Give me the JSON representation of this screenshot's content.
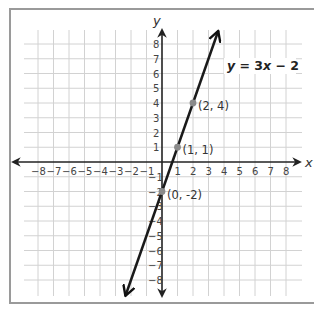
{
  "chart_data": {
    "type": "line",
    "title": "",
    "xlabel": "x",
    "ylabel": "y",
    "xlim": [
      -8,
      8
    ],
    "ylim": [
      -8,
      8
    ],
    "grid": true,
    "x_ticks": [
      "-8",
      "-7",
      "-6",
      "-5",
      "-4",
      "-3",
      "-2",
      "-1",
      "1",
      "2",
      "3",
      "4",
      "5",
      "6",
      "7",
      "8"
    ],
    "y_ticks": [
      "8",
      "7",
      "6",
      "5",
      "4",
      "3",
      "2",
      "1",
      "-1",
      "-2",
      "-3",
      "-4",
      "-5",
      "-6",
      "-7",
      "-8"
    ],
    "series": [
      {
        "name": "y = 3x - 2",
        "equation": "y = 3x − 2",
        "slope": 3,
        "intercept": -2,
        "color": "#1a1a1a",
        "line_extent_x": [
          -2.36,
          3.63
        ],
        "arrows": "both"
      }
    ],
    "points": [
      {
        "x": 2,
        "y": 4,
        "label": "(2, 4)"
      },
      {
        "x": 1,
        "y": 1,
        "label": "(1, 1)"
      },
      {
        "x": 0,
        "y": -2,
        "label": "(0, -2)"
      }
    ],
    "annotations": [
      {
        "text": "y = 3x − 2",
        "position": "upper-right"
      }
    ],
    "point_color": "#8a8a8a",
    "grid_color": "#d2d2d2",
    "axis_color": "#222222"
  }
}
